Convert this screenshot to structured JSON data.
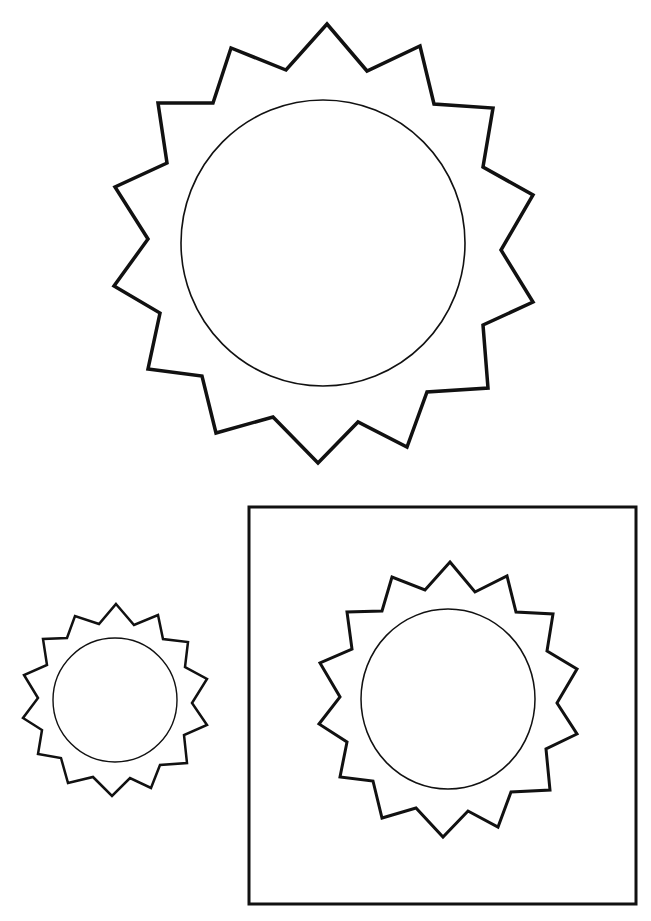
{
  "page": {
    "background": "#ffffff",
    "stroke_color": "#111111"
  },
  "suns": [
    {
      "id": "large-sun",
      "rays": 14,
      "outline_points": [
        [
          327,
          24
        ],
        [
          367,
          71
        ],
        [
          420,
          46
        ],
        [
          434,
          104
        ],
        [
          493,
          108
        ],
        [
          483,
          167
        ],
        [
          533,
          195
        ],
        [
          501,
          250
        ],
        [
          533,
          302
        ],
        [
          483,
          325
        ],
        [
          488,
          388
        ],
        [
          427,
          392
        ],
        [
          407,
          447
        ],
        [
          358,
          422
        ],
        [
          318,
          463
        ],
        [
          273,
          417
        ],
        [
          216,
          433
        ],
        [
          202,
          376
        ],
        [
          148,
          369
        ],
        [
          160,
          313
        ],
        [
          114,
          286
        ],
        [
          148,
          239
        ],
        [
          115,
          187
        ],
        [
          167,
          163
        ],
        [
          158,
          103
        ],
        [
          213,
          103
        ],
        [
          231,
          48
        ],
        [
          286,
          70
        ]
      ],
      "outline_width": 3.5,
      "circle": {
        "cx": 323,
        "cy": 243,
        "rx": 142,
        "ry": 143
      },
      "circle_width": 1.6
    },
    {
      "id": "small-sun",
      "rays": 14,
      "outline_points": [
        [
          116,
          604
        ],
        [
          134,
          625
        ],
        [
          158,
          615
        ],
        [
          163,
          639
        ],
        [
          188,
          642
        ],
        [
          185,
          667
        ],
        [
          207,
          679
        ],
        [
          192,
          703
        ],
        [
          207,
          725
        ],
        [
          184,
          735
        ],
        [
          187,
          763
        ],
        [
          160,
          765
        ],
        [
          151,
          788
        ],
        [
          130,
          778
        ],
        [
          112,
          796
        ],
        [
          93,
          777
        ],
        [
          68,
          783
        ],
        [
          61,
          758
        ],
        [
          38,
          754
        ],
        [
          42,
          730
        ],
        [
          23,
          718
        ],
        [
          38,
          698
        ],
        [
          24,
          675
        ],
        [
          47,
          665
        ],
        [
          43,
          639
        ],
        [
          67,
          638
        ],
        [
          75,
          616
        ],
        [
          99,
          624
        ]
      ],
      "outline_width": 2.5,
      "circle": {
        "cx": 115,
        "cy": 700,
        "rx": 62,
        "ry": 62
      },
      "circle_width": 1.4
    },
    {
      "id": "boxed-sun",
      "rays": 14,
      "outline_points": [
        [
          450,
          562
        ],
        [
          475,
          592
        ],
        [
          507,
          576
        ],
        [
          516,
          612
        ],
        [
          553,
          614
        ],
        [
          547,
          651
        ],
        [
          577,
          669
        ],
        [
          557,
          703
        ],
        [
          577,
          734
        ],
        [
          546,
          749
        ],
        [
          550,
          790
        ],
        [
          511,
          792
        ],
        [
          498,
          827
        ],
        [
          468,
          811
        ],
        [
          443,
          837
        ],
        [
          416,
          808
        ],
        [
          382,
          818
        ],
        [
          373,
          781
        ],
        [
          340,
          777
        ],
        [
          347,
          742
        ],
        [
          319,
          724
        ],
        [
          340,
          697
        ],
        [
          320,
          663
        ],
        [
          352,
          649
        ],
        [
          347,
          612
        ],
        [
          382,
          611
        ],
        [
          392,
          577
        ],
        [
          425,
          590
        ]
      ],
      "outline_width": 3,
      "circle": {
        "cx": 448,
        "cy": 699,
        "rx": 87,
        "ry": 90
      },
      "circle_width": 1.5
    }
  ],
  "frame": {
    "x": 249,
    "y": 507,
    "width": 387,
    "height": 397,
    "stroke_width": 3
  }
}
